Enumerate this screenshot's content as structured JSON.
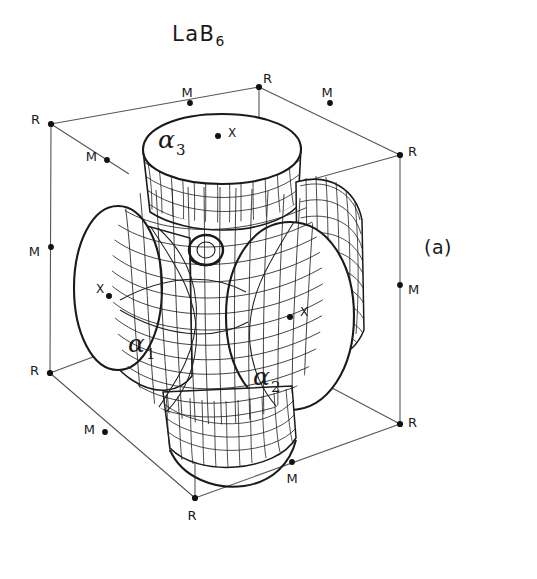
{
  "figure": {
    "title_main": "LaB",
    "title_sub": "6",
    "panel_label": "(a)",
    "caption_text": "LaB6"
  },
  "colors": {
    "ink": "#1a1a1a",
    "background": "#ffffff",
    "cube_line": "#555555",
    "mesh_line": "#222222"
  },
  "surface_labels": [
    {
      "name": "alpha-1",
      "symbol": "α",
      "sub": "1",
      "x": 128,
      "y": 352
    },
    {
      "name": "alpha-2",
      "symbol": "α",
      "sub": "2",
      "x": 253,
      "y": 385
    },
    {
      "name": "alpha-3",
      "symbol": "α",
      "sub": "3",
      "x": 158,
      "y": 148
    }
  ],
  "x_points": [
    {
      "label": "X",
      "dot_x": 218,
      "dot_y": 136,
      "text_x": 228,
      "text_y": 133
    },
    {
      "label": "X",
      "dot_x": 109,
      "dot_y": 296,
      "text_x": 96,
      "text_y": 289
    },
    {
      "label": "X",
      "dot_x": 290,
      "dot_y": 317,
      "text_x": 300,
      "text_y": 312
    }
  ],
  "cube_vertices": [
    {
      "label": "R",
      "dot_x": 259,
      "dot_y": 87,
      "text_x": 263,
      "text_y": 79,
      "anchor": "start"
    },
    {
      "label": "R",
      "dot_x": 51,
      "dot_y": 124,
      "text_x": 40,
      "text_y": 120,
      "anchor": "end"
    },
    {
      "label": "R",
      "dot_x": 400,
      "dot_y": 155,
      "text_x": 408,
      "text_y": 152,
      "anchor": "start"
    },
    {
      "label": "R",
      "dot_x": 50,
      "dot_y": 373,
      "text_x": 39,
      "text_y": 371,
      "anchor": "end"
    },
    {
      "label": "R",
      "dot_x": 400,
      "dot_y": 424,
      "text_x": 408,
      "text_y": 423,
      "anchor": "start"
    },
    {
      "label": "R",
      "dot_x": 195,
      "dot_y": 498,
      "text_x": 192,
      "text_y": 516,
      "anchor": "middle"
    }
  ],
  "edge_midpoints": [
    {
      "label": "M",
      "dot_x": 190,
      "dot_y": 103,
      "text_x": 187,
      "text_y": 93,
      "anchor": "middle"
    },
    {
      "label": "M",
      "dot_x": 330,
      "dot_y": 103,
      "text_x": 327,
      "text_y": 93,
      "anchor": "middle"
    },
    {
      "label": "M",
      "dot_x": 107,
      "dot_y": 160,
      "text_x": 97,
      "text_y": 157,
      "anchor": "end"
    },
    {
      "label": "M",
      "dot_x": 51,
      "dot_y": 247,
      "text_x": 40,
      "text_y": 252,
      "anchor": "end"
    },
    {
      "label": "M",
      "dot_x": 400,
      "dot_y": 285,
      "text_x": 408,
      "text_y": 290,
      "anchor": "start"
    },
    {
      "label": "M",
      "dot_x": 105,
      "dot_y": 432,
      "text_x": 95,
      "text_y": 430,
      "anchor": "end"
    },
    {
      "label": "M",
      "dot_x": 292,
      "dot_y": 462,
      "text_x": 292,
      "text_y": 479,
      "anchor": "middle"
    }
  ],
  "geometry": {
    "cube_edges": [
      {
        "name": "top-back-left",
        "x1": 51,
        "y1": 124,
        "x2": 259,
        "y2": 87
      },
      {
        "name": "top-back-right",
        "x1": 259,
        "y1": 87,
        "x2": 400,
        "y2": 155
      },
      {
        "name": "top-front-left",
        "x1": 51,
        "y1": 124,
        "x2": 163,
        "y2": 196
      },
      {
        "name": "top-front-right",
        "x1": 163,
        "y1": 196,
        "x2": 400,
        "y2": 155
      },
      {
        "name": "vertical-left",
        "x1": 51,
        "y1": 124,
        "x2": 50,
        "y2": 373
      },
      {
        "name": "vertical-right",
        "x1": 400,
        "y1": 155,
        "x2": 400,
        "y2": 424
      },
      {
        "name": "vertical-back",
        "x1": 259,
        "y1": 87,
        "x2": 259,
        "y2": 196
      },
      {
        "name": "vertical-front",
        "x1": 195,
        "y1": 320,
        "x2": 195,
        "y2": 498
      },
      {
        "name": "bottom-left",
        "x1": 50,
        "y1": 373,
        "x2": 195,
        "y2": 498
      },
      {
        "name": "bottom-right",
        "x1": 195,
        "y1": 498,
        "x2": 400,
        "y2": 424
      },
      {
        "name": "bottom-back-left",
        "x1": 50,
        "y1": 373,
        "x2": 163,
        "y2": 330
      },
      {
        "name": "bottom-back-right",
        "x1": 285,
        "y1": 366,
        "x2": 400,
        "y2": 424
      }
    ]
  }
}
